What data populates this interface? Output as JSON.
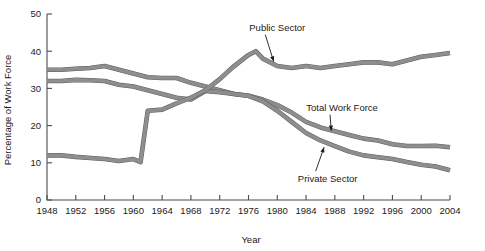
{
  "chart_data": {
    "type": "line",
    "title": "",
    "xlabel": "Year",
    "ylabel": "Percentage of Work Force",
    "xlim": [
      1948,
      2004
    ],
    "ylim": [
      0,
      50
    ],
    "grid": false,
    "legend_position": "inline-annotations",
    "x_ticks": [
      1948,
      1952,
      1956,
      1960,
      1964,
      1968,
      1972,
      1976,
      1980,
      1984,
      1988,
      1992,
      1996,
      2000,
      2004
    ],
    "y_ticks": [
      0,
      10,
      20,
      30,
      40,
      50
    ],
    "series": [
      {
        "name": "Total Work Force",
        "color": "#8e8e8e",
        "x": [
          1948,
          1950,
          1952,
          1954,
          1956,
          1958,
          1960,
          1962,
          1964,
          1966,
          1968,
          1970,
          1972,
          1974,
          1976,
          1978,
          1980,
          1982,
          1984,
          1986,
          1988,
          1990,
          1992,
          1994,
          1996,
          1998,
          2000,
          2002,
          2004
        ],
        "values": [
          35.0,
          35.0,
          35.3,
          35.5,
          36.0,
          35.0,
          34.0,
          33.0,
          32.8,
          32.8,
          31.5,
          30.5,
          29.5,
          28.5,
          28.0,
          27.0,
          25.5,
          23.5,
          21.0,
          19.5,
          18.5,
          17.5,
          16.5,
          16.0,
          15.0,
          14.5,
          14.5,
          14.6,
          14.2
        ]
      },
      {
        "name": "Private Sector",
        "color": "#8e8e8e",
        "x": [
          1948,
          1950,
          1952,
          1954,
          1956,
          1958,
          1960,
          1962,
          1964,
          1966,
          1968,
          1970,
          1972,
          1974,
          1976,
          1978,
          1980,
          1982,
          1984,
          1986,
          1988,
          1990,
          1992,
          1994,
          1996,
          1998,
          2000,
          2002,
          2004
        ],
        "values": [
          32.0,
          32.0,
          32.3,
          32.2,
          32.0,
          31.0,
          30.5,
          29.5,
          28.5,
          27.5,
          27.0,
          29.3,
          29.0,
          28.5,
          28.0,
          26.5,
          24.0,
          21.0,
          18.0,
          16.0,
          14.5,
          13.0,
          12.0,
          11.5,
          11.0,
          10.2,
          9.5,
          9.0,
          8.0
        ]
      },
      {
        "name": "Public Sector",
        "color": "#8e8e8e",
        "x": [
          1948,
          1950,
          1952,
          1954,
          1956,
          1958,
          1960,
          1961,
          1962,
          1964,
          1966,
          1968,
          1970,
          1972,
          1974,
          1976,
          1977,
          1978,
          1980,
          1982,
          1984,
          1986,
          1988,
          1990,
          1992,
          1994,
          1996,
          1998,
          2000,
          2002,
          2004
        ],
        "values": [
          12.0,
          12.0,
          11.6,
          11.3,
          11.0,
          10.5,
          11.0,
          10.2,
          24.0,
          24.3,
          26.0,
          27.5,
          29.5,
          32.5,
          36.0,
          39.0,
          40.0,
          38.0,
          36.0,
          35.5,
          36.0,
          35.5,
          36.0,
          36.5,
          37.0,
          37.0,
          36.5,
          37.5,
          38.5,
          39.0,
          39.5
        ]
      }
    ],
    "annotations": [
      {
        "label": "Public Sector",
        "text_x": 1980,
        "text_y": 45.5,
        "point_x": 1979.5,
        "point_y": 37.2
      },
      {
        "label": "Total Work Force",
        "text_x": 1989,
        "text_y": 24.0,
        "point_x": 1987.5,
        "point_y": 18.6
      },
      {
        "label": "Private Sector",
        "text_x": 1987,
        "text_y": 4.8,
        "point_x": 1986.5,
        "point_y": 14.2
      }
    ]
  }
}
